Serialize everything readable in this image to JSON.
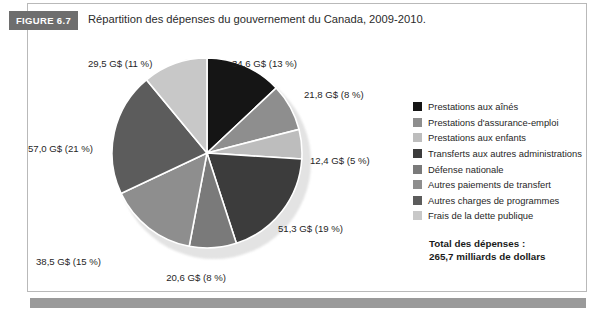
{
  "figure": {
    "badge": "FIGURE 6.7",
    "title": "Répartition des dépenses du gouvernement du Canada, 2009-2010."
  },
  "legend": {
    "items": [
      {
        "label": "Prestations aux aînés",
        "color": "#151515"
      },
      {
        "label": "Prestations d'assurance-emploi",
        "color": "#8e8e8e"
      },
      {
        "label": "Prestations aux enfants",
        "color": "#bdbdbd"
      },
      {
        "label": "Transferts aux autres administrations",
        "color": "#3c3c3c"
      },
      {
        "label": "Défense nationale",
        "color": "#7a7a7a"
      },
      {
        "label": "Autres paiements de transfert",
        "color": "#8e8e8e"
      },
      {
        "label": "Autres charges de programmes",
        "color": "#5c5c5c"
      },
      {
        "label": "Frais de la dette publique",
        "color": "#c8c8c8"
      }
    ]
  },
  "total": {
    "line1": "Total des dépenses :",
    "line2": "265,7 milliards de dollars"
  },
  "chart_data": {
    "type": "pie",
    "title": "Répartition des dépenses du gouvernement du Canada, 2009-2010.",
    "unit": "G$",
    "total_value": 265.7,
    "total_label": "265,7 milliards de dollars",
    "legend_position": "right",
    "categories": [
      "Prestations aux aînés",
      "Prestations d'assurance-emploi",
      "Prestations aux enfants",
      "Transferts aux autres administrations",
      "Défense nationale",
      "Autres paiements de transfert",
      "Autres charges de programmes",
      "Frais de la dette publique"
    ],
    "values": [
      34.6,
      21.8,
      12.4,
      51.3,
      20.6,
      38.5,
      57.0,
      29.5
    ],
    "percents": [
      13,
      8,
      5,
      19,
      8,
      15,
      21,
      11
    ],
    "colors": [
      "#151515",
      "#8e8e8e",
      "#bdbdbd",
      "#3c3c3c",
      "#7a7a7a",
      "#8e8e8e",
      "#5c5c5c",
      "#c8c8c8"
    ],
    "data_labels": [
      "34,6 G$ (13 %)",
      "21,8 G$ (8 %)",
      "12,4 G$ (5 %)",
      "51,3 G$ (19 %)",
      "20,6 G$ (8 %)",
      "38,5 G$ (15 %)",
      "57,0 G$ (21 %)",
      "29,5 G$ (11 %)"
    ]
  }
}
